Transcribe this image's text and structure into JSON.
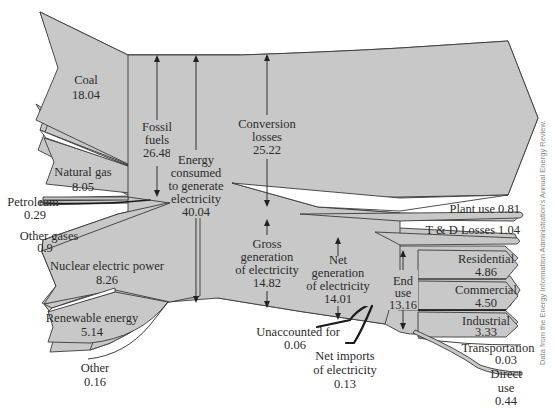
{
  "diagram": {
    "credit": "Data from the Energy Information Administration's Annual Energy Review.",
    "colors": {
      "flow_fill": "#c8c8c8",
      "stroke": "#3a3a3a",
      "text": "#2b2b2b",
      "background": "#ffffff"
    },
    "sources": [
      {
        "id": "coal",
        "name": "Coal",
        "value": "18.04"
      },
      {
        "id": "natural_gas",
        "name": "Natural gas",
        "value": "8.05"
      },
      {
        "id": "petroleum",
        "name": "Petroleum",
        "value": "0.29"
      },
      {
        "id": "other_gases",
        "name": "Other gases",
        "value": "0.9"
      },
      {
        "id": "nuclear",
        "name": "Nuclear electric power",
        "value": "8.26"
      },
      {
        "id": "renewable",
        "name": "Renewable energy",
        "value": "5.14"
      },
      {
        "id": "other",
        "name": "Other",
        "value": "0.16"
      }
    ],
    "totals": {
      "fossil_fuels": {
        "line1": "Fossil",
        "line2": "fuels",
        "value": "26.48"
      },
      "energy_consumed": {
        "line1": "Energy",
        "line2": "consumed",
        "line3": "to generate",
        "line4": "electricity",
        "value": "40.04"
      },
      "conversion_losses": {
        "line1": "Conversion",
        "line2": "losses",
        "value": "25.22"
      },
      "gross_generation": {
        "line1": "Gross",
        "line2": "generation",
        "line3": "of electricity",
        "value": "14.82"
      },
      "net_generation": {
        "line1": "Net",
        "line2": "generation",
        "line3": "of electricity",
        "value": "14.01"
      },
      "end_use": {
        "line1": "End",
        "line2": "use",
        "value": "13.16"
      }
    },
    "losses": [
      {
        "id": "plant_use",
        "label": "Plant use 0.81"
      },
      {
        "id": "td_losses",
        "label": "T & D Losses 1.04"
      }
    ],
    "inputs": [
      {
        "id": "unaccounted",
        "name": "Unaccounted for",
        "value": "0.06"
      },
      {
        "id": "net_imports",
        "line1": "Net imports",
        "line2": "of electricity",
        "value": "0.13"
      }
    ],
    "end_uses": [
      {
        "id": "residential",
        "name": "Residential",
        "value": "4.86"
      },
      {
        "id": "commercial",
        "name": "Commercial",
        "value": "4.50"
      },
      {
        "id": "industrial",
        "name": "Industrial",
        "value": "3.33"
      },
      {
        "id": "transportation",
        "name": "Transportation",
        "value": "0.03"
      },
      {
        "id": "direct_use",
        "line1": "Direct",
        "line2": "use",
        "value": "0.44"
      }
    ]
  }
}
